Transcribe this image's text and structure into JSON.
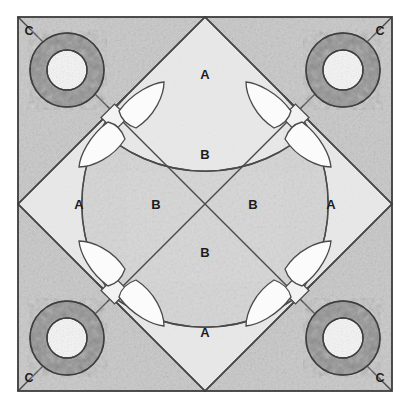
{
  "diagram": {
    "type": "quilt-block-piecing-diagram",
    "canvas": {
      "width": 411,
      "height": 408,
      "background": "#ffffff"
    },
    "frame": {
      "x": 18,
      "y": 17,
      "width": 374,
      "height": 374,
      "stroke": "#3c3c3c",
      "stroke_width": 1.6
    },
    "colors": {
      "background_c": "#c9c9c9",
      "background_b": "#d4d4d4",
      "patch_a": "#e8e8e8",
      "flower_ring": "#8f8f8f",
      "flower_center": "#f4f4f4",
      "leaf": "#fbfbfb",
      "stem": "#f2f2f2",
      "outline": "#4a4a4a",
      "label_text": "#1c1c1c",
      "page": "#ffffff"
    },
    "geometry": {
      "center": {
        "x": 205,
        "y": 204
      },
      "diamond_vertices": [
        {
          "x": 205,
          "y": 17
        },
        {
          "x": 392,
          "y": 204
        },
        {
          "x": 205,
          "y": 391
        },
        {
          "x": 18,
          "y": 204
        }
      ],
      "arc_radius": 108,
      "flower_centers": [
        {
          "x": 67,
          "y": 70
        },
        {
          "x": 343,
          "y": 70
        },
        {
          "x": 67,
          "y": 338
        },
        {
          "x": 343,
          "y": 338
        }
      ],
      "flower_ring_outer_radius": 37,
      "flower_ring_inner_radius": 20
    },
    "labels": {
      "patch_a": "A",
      "patch_b": "B",
      "patch_c": "C"
    },
    "label_positions": {
      "a": [
        {
          "x": 205,
          "y": 76
        },
        {
          "x": 79,
          "y": 205
        },
        {
          "x": 331,
          "y": 205
        },
        {
          "x": 205,
          "y": 333
        }
      ],
      "b": [
        {
          "x": 205,
          "y": 155
        },
        {
          "x": 155,
          "y": 205
        },
        {
          "x": 252,
          "y": 205
        },
        {
          "x": 205,
          "y": 253
        }
      ],
      "c": [
        {
          "x": 29,
          "y": 31
        },
        {
          "x": 380,
          "y": 31
        },
        {
          "x": 29,
          "y": 378
        },
        {
          "x": 380,
          "y": 378
        }
      ]
    },
    "legend": {
      "a_description": "A",
      "b_description": "B",
      "c_description": "C"
    }
  }
}
